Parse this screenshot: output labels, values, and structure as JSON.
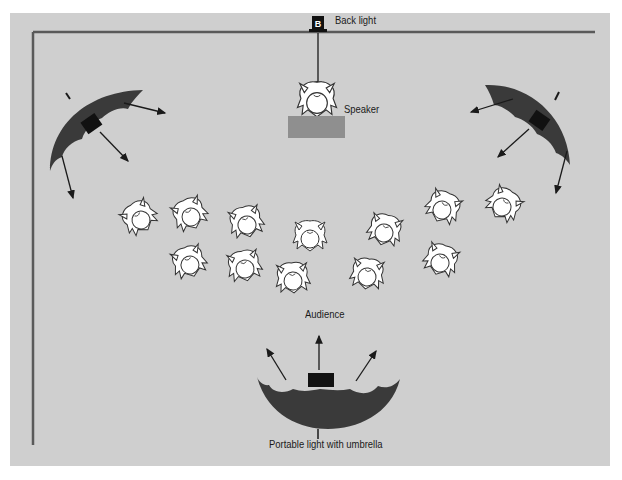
{
  "diagram": {
    "labels": {
      "back_light": "Back light",
      "back_light_badge": "B",
      "speaker": "Speaker",
      "audience": "Audience",
      "portable_light": "Portable light with umbrella"
    },
    "colors": {
      "background": "#cfcfcf",
      "frame": "#5a5a5a",
      "umbrella": "#3a3a3a",
      "light_box": "#111111",
      "podium": "#8f8f8f",
      "person_fill": "#ffffff",
      "person_stroke": "#333333"
    },
    "elements": {
      "umbrella_lights": [
        "top-left",
        "top-right",
        "bottom-center"
      ],
      "audience_count": 14
    }
  }
}
